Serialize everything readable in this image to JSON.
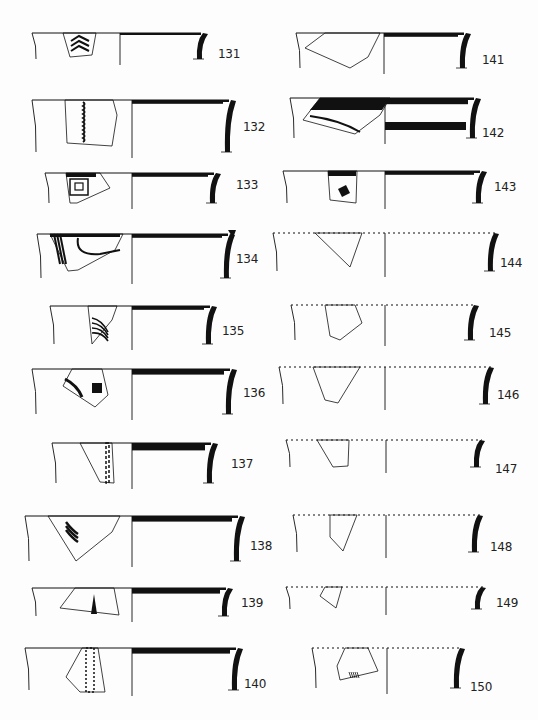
{
  "plate": {
    "width": 538,
    "height": 720,
    "ink": "#111111",
    "paper": "#fdfdfd"
  },
  "sherds": [
    {
      "id": "131",
      "x0": 32,
      "x1": 205,
      "y": 33,
      "h": 26,
      "mid": 120,
      "wall": "solid",
      "dotted": false,
      "rimBand": 0,
      "innerBand": 0,
      "labelX": 218,
      "labelY": 57,
      "frag": [
        [
          63,
          33
        ],
        [
          96,
          33
        ],
        [
          92,
          55
        ],
        [
          70,
          57
        ]
      ],
      "motif": "chevrons"
    },
    {
      "id": "132",
      "x0": 32,
      "x1": 233,
      "y": 100,
      "h": 52,
      "mid": 132,
      "wall": "solid",
      "dotted": false,
      "rimBand": 3,
      "innerBand": 0,
      "labelX": 243,
      "labelY": 130,
      "frag": [
        [
          65,
          100
        ],
        [
          113,
          100
        ],
        [
          117,
          115
        ],
        [
          112,
          146
        ],
        [
          67,
          143
        ]
      ],
      "motif": "wavy-line"
    },
    {
      "id": "133",
      "x0": 45,
      "x1": 218,
      "y": 173,
      "h": 30,
      "mid": 132,
      "wall": "solid",
      "dotted": false,
      "rimBand": 3,
      "innerBand": 0,
      "labelX": 236,
      "labelY": 188,
      "frag": [
        [
          66,
          173
        ],
        [
          100,
          173
        ],
        [
          110,
          188
        ],
        [
          77,
          203
        ],
        [
          70,
          203
        ]
      ],
      "motif": "spiral"
    },
    {
      "id": "134",
      "x0": 37,
      "x1": 232,
      "y": 234,
      "h": 44,
      "mid": 132,
      "wall": "flanged",
      "dotted": false,
      "rimBand": 3,
      "innerBand": 0,
      "labelX": 236,
      "labelY": 262,
      "frag": [
        [
          50,
          234
        ],
        [
          123,
          234
        ],
        [
          115,
          250
        ],
        [
          78,
          270
        ],
        [
          68,
          271
        ]
      ],
      "motif": "curved-bands"
    },
    {
      "id": "135",
      "x0": 50,
      "x1": 214,
      "y": 306,
      "h": 38,
      "mid": 132,
      "wall": "solid",
      "dotted": false,
      "rimBand": 3,
      "innerBand": 0,
      "labelX": 222,
      "labelY": 334,
      "frag": [
        [
          88,
          306
        ],
        [
          117,
          306
        ],
        [
          112,
          320
        ],
        [
          92,
          344
        ]
      ],
      "motif": "arcs"
    },
    {
      "id": "136",
      "x0": 32,
      "x1": 234,
      "y": 369,
      "h": 45,
      "mid": 132,
      "wall": "solid",
      "dotted": false,
      "rimBand": 6,
      "innerBand": 0,
      "labelX": 243,
      "labelY": 396,
      "frag": [
        [
          72,
          369
        ],
        [
          102,
          369
        ],
        [
          108,
          395
        ],
        [
          95,
          407
        ],
        [
          63,
          386
        ]
      ],
      "motif": "triangle-dots"
    },
    {
      "id": "137",
      "x0": 52,
      "x1": 215,
      "y": 443,
      "h": 40,
      "mid": 132,
      "wall": "solid",
      "dotted": false,
      "rimBand": 9,
      "innerBand": 0,
      "labelX": 231,
      "labelY": 467,
      "frag": [
        [
          80,
          443
        ],
        [
          112,
          443
        ],
        [
          114,
          483
        ],
        [
          100,
          482
        ]
      ],
      "motif": "ladder"
    },
    {
      "id": "138",
      "x0": 25,
      "x1": 242,
      "y": 516,
      "h": 45,
      "mid": 132,
      "wall": "solid",
      "dotted": false,
      "rimBand": 6,
      "innerBand": 0,
      "labelX": 250,
      "labelY": 549,
      "frag": [
        [
          48,
          516
        ],
        [
          120,
          516
        ],
        [
          112,
          532
        ],
        [
          76,
          561
        ]
      ],
      "motif": "branch"
    },
    {
      "id": "139",
      "x0": 32,
      "x1": 230,
      "y": 588,
      "h": 28,
      "mid": 132,
      "wall": "solid",
      "dotted": false,
      "rimBand": 6,
      "innerBand": 0,
      "labelX": 241,
      "labelY": 606,
      "frag": [
        [
          75,
          588
        ],
        [
          114,
          588
        ],
        [
          119,
          615
        ],
        [
          60,
          608
        ]
      ],
      "motif": "drip"
    },
    {
      "id": "140",
      "x0": 25,
      "x1": 240,
      "y": 648,
      "h": 42,
      "mid": 132,
      "wall": "solid",
      "dotted": false,
      "rimBand": 6,
      "innerBand": 0,
      "labelX": 244,
      "labelY": 687,
      "frag": [
        [
          82,
          648
        ],
        [
          98,
          648
        ],
        [
          105,
          692
        ],
        [
          80,
          692
        ],
        [
          66,
          677
        ]
      ],
      "motif": "checker-band"
    },
    {
      "id": "141",
      "x0": 296,
      "x1": 468,
      "y": 33,
      "h": 35,
      "mid": 384,
      "wall": "solid",
      "dotted": false,
      "rimBand": 3,
      "innerBand": 0,
      "labelX": 482,
      "labelY": 63,
      "frag": [
        [
          325,
          33
        ],
        [
          380,
          33
        ],
        [
          368,
          57
        ],
        [
          350,
          68
        ],
        [
          305,
          48
        ]
      ],
      "motif": "none"
    },
    {
      "id": "142",
      "x0": 290,
      "x1": 478,
      "y": 98,
      "h": 40,
      "mid": 385,
      "wall": "solid",
      "dotted": false,
      "rimBand": 7,
      "innerBand": 8,
      "labelX": 482,
      "labelY": 136,
      "frag": [
        [
          320,
          98
        ],
        [
          390,
          98
        ],
        [
          380,
          115
        ],
        [
          355,
          134
        ],
        [
          303,
          120
        ]
      ],
      "motif": "wide-band"
    },
    {
      "id": "143",
      "x0": 283,
      "x1": 484,
      "y": 171,
      "h": 32,
      "mid": 385,
      "wall": "solid",
      "dotted": false,
      "rimBand": 3,
      "innerBand": 0,
      "labelX": 494,
      "labelY": 190,
      "frag": [
        [
          328,
          171
        ],
        [
          357,
          171
        ],
        [
          356,
          203
        ],
        [
          330,
          200
        ]
      ],
      "motif": "lozenge"
    },
    {
      "id": "144",
      "x0": 273,
      "x1": 496,
      "y": 233,
      "h": 38,
      "mid": 385,
      "wall": "solid",
      "dotted": true,
      "rimBand": 0,
      "innerBand": 0,
      "labelX": 500,
      "labelY": 266,
      "frag": [
        [
          315,
          233
        ],
        [
          362,
          233
        ],
        [
          350,
          267
        ]
      ],
      "motif": "none"
    },
    {
      "id": "145",
      "x0": 291,
      "x1": 476,
      "y": 305,
      "h": 35,
      "mid": 385,
      "wall": "solid",
      "dotted": true,
      "rimBand": 0,
      "innerBand": 0,
      "labelX": 489,
      "labelY": 336,
      "frag": [
        [
          325,
          305
        ],
        [
          355,
          305
        ],
        [
          362,
          323
        ],
        [
          340,
          340
        ],
        [
          330,
          336
        ]
      ],
      "motif": "none"
    },
    {
      "id": "146",
      "x0": 279,
      "x1": 491,
      "y": 367,
      "h": 37,
      "mid": 385,
      "wall": "solid",
      "dotted": true,
      "rimBand": 0,
      "innerBand": 0,
      "labelX": 497,
      "labelY": 398,
      "frag": [
        [
          313,
          367
        ],
        [
          360,
          367
        ],
        [
          338,
          403
        ],
        [
          325,
          400
        ]
      ],
      "motif": "none"
    },
    {
      "id": "147",
      "x0": 286,
      "x1": 482,
      "y": 440,
      "h": 27,
      "mid": 386,
      "wall": "solid",
      "dotted": true,
      "rimBand": 0,
      "innerBand": 0,
      "labelX": 495,
      "labelY": 472,
      "frag": [
        [
          317,
          440
        ],
        [
          349,
          440
        ],
        [
          348,
          466
        ],
        [
          333,
          467
        ]
      ],
      "motif": "none"
    },
    {
      "id": "148",
      "x0": 293,
      "x1": 480,
      "y": 515,
      "h": 37,
      "mid": 386,
      "wall": "solid",
      "dotted": true,
      "rimBand": 0,
      "innerBand": 0,
      "labelX": 490,
      "labelY": 550,
      "frag": [
        [
          330,
          515
        ],
        [
          357,
          515
        ],
        [
          343,
          551
        ],
        [
          330,
          537
        ]
      ],
      "motif": "none"
    },
    {
      "id": "149",
      "x0": 286,
      "x1": 483,
      "y": 587,
      "h": 22,
      "mid": 386,
      "wall": "solid",
      "dotted": true,
      "rimBand": 0,
      "innerBand": 0,
      "labelX": 496,
      "labelY": 606,
      "frag": [
        [
          325,
          587
        ],
        [
          342,
          587
        ],
        [
          336,
          608
        ],
        [
          320,
          596
        ]
      ],
      "motif": "none"
    },
    {
      "id": "150",
      "x0": 312,
      "x1": 462,
      "y": 648,
      "h": 40,
      "mid": 387,
      "wall": "solid",
      "dotted": true,
      "rimBand": 0,
      "innerBand": 0,
      "labelX": 470,
      "labelY": 690,
      "frag": [
        [
          345,
          648
        ],
        [
          368,
          648
        ],
        [
          378,
          671
        ],
        [
          340,
          680
        ],
        [
          337,
          666
        ]
      ],
      "motif": "hatch"
    }
  ]
}
